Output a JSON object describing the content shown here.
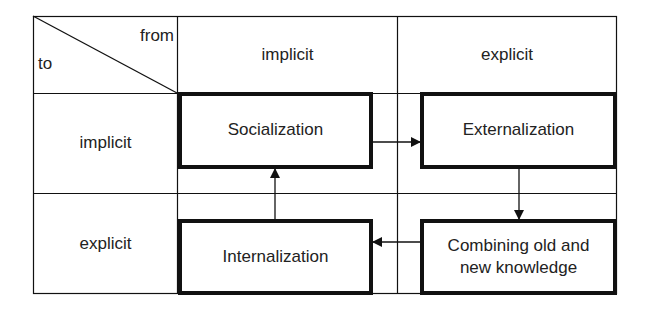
{
  "diagram": {
    "type": "knowledge-conversion-matrix",
    "corner": {
      "from_label": "from",
      "to_label": "to"
    },
    "column_headers": [
      "implicit",
      "explicit"
    ],
    "row_headers": [
      "implicit",
      "explicit"
    ],
    "quadrants": {
      "implicit_implicit": "Socialization",
      "implicit_explicit": "Externalization",
      "explicit_implicit": "Internalization",
      "explicit_explicit_line1": "Combining old and",
      "explicit_explicit_line2": "new knowledge"
    },
    "flows": [
      {
        "from": "Socialization",
        "to": "Externalization",
        "direction": "right"
      },
      {
        "from": "Externalization",
        "to": "Combining old and new knowledge",
        "direction": "down"
      },
      {
        "from": "Combining old and new knowledge",
        "to": "Internalization",
        "direction": "left"
      },
      {
        "from": "Internalization",
        "to": "Socialization",
        "direction": "up"
      }
    ],
    "colors": {
      "line": "#111111",
      "text": "#222222",
      "background": "#ffffff"
    }
  }
}
